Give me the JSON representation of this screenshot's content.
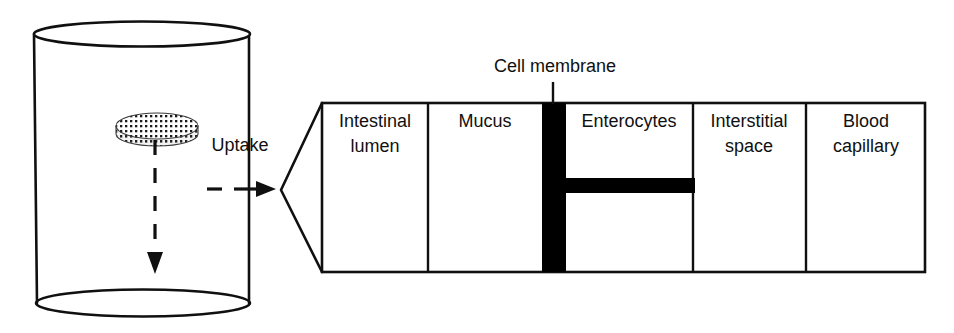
{
  "figure": {
    "kind": "schematic-diagram",
    "background_color": "#ffffff",
    "stroke_color": "#101010",
    "fill_white": "#ffffff",
    "membrane_color": "#000000"
  },
  "dissolution": {
    "vessel_name": "dissolution-vessel-cylinder",
    "tablet_name": "dosage-form-tablet-disc",
    "tablet_pattern": "stippled-dotted",
    "dissolution_arrow_name": "dissolution-dashed-down-arrow",
    "uptake_arrow_name": "uptake-dashed-right-arrow",
    "uptake_label": "Uptake"
  },
  "callout": {
    "name": "magnification-funnel",
    "apex_x": 281,
    "apex_y": 190
  },
  "membrane": {
    "label": "Cell membrane",
    "leader_name": "cell-membrane-leader-line",
    "vertical_bar_name": "cell-membrane-vertical-bar",
    "horizontal_bar_name": "cell-membrane-horizontal-bar",
    "color": "#000000"
  },
  "compartments": [
    {
      "id": "intestinal-lumen",
      "lines": [
        "Intestinal",
        "lumen"
      ],
      "x": 322,
      "width": 106
    },
    {
      "id": "mucus",
      "lines": [
        "Mucus"
      ],
      "x": 428,
      "width": 114
    },
    {
      "id": "enterocytes",
      "lines": [
        "Enterocytes"
      ],
      "x": 565,
      "width": 128
    },
    {
      "id": "interstitial-space",
      "lines": [
        "Interstitial",
        "space"
      ],
      "x": 693,
      "width": 113
    },
    {
      "id": "blood-capillary",
      "lines": [
        "Blood",
        "capillary"
      ],
      "x": 806,
      "width": 119
    }
  ],
  "geometry": {
    "box_top": 103,
    "box_bottom": 272,
    "box_left": 322,
    "box_right": 925,
    "membrane_x": 542,
    "membrane_width": 24,
    "membrane_bar_y": 178,
    "membrane_bar_height": 15,
    "membrane_bar_right": 695
  }
}
